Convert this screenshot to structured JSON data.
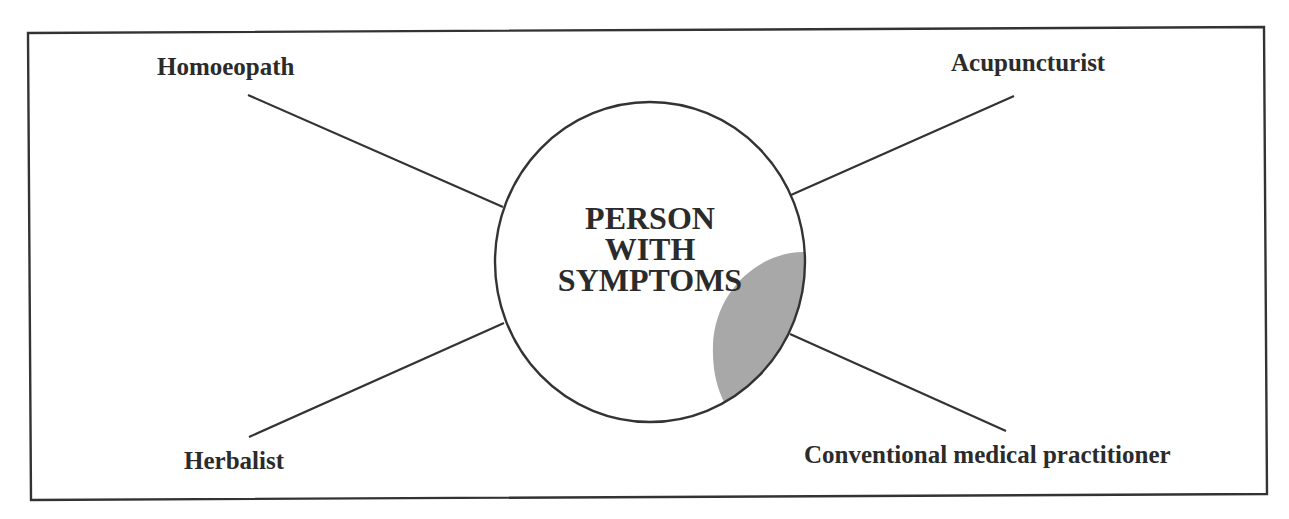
{
  "diagram": {
    "center": {
      "lines": [
        "PERSON",
        "WITH",
        "SYMPTOMS"
      ]
    },
    "practitioners": [
      {
        "label": "Homoeopath",
        "position": "top-left"
      },
      {
        "label": "Acupuncturist",
        "position": "top-right"
      },
      {
        "label": "Herbalist",
        "position": "bottom-left"
      },
      {
        "label": "Conventional medical practitioner",
        "position": "bottom-right"
      }
    ],
    "colors": {
      "line": "#333333",
      "text": "#2b2b2b",
      "shaded_segment": "#a8a8a8",
      "background": "#ffffff"
    }
  }
}
